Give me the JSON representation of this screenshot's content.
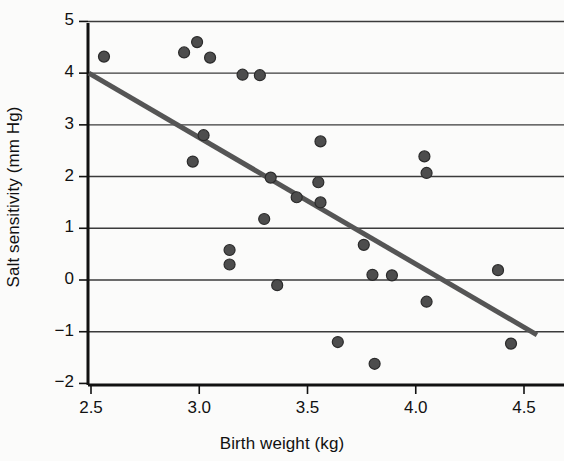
{
  "chart_data": {
    "type": "scatter",
    "title": "",
    "xlabel": "Birth weight (kg)",
    "ylabel": "Salt sensitivity (mm Hg)",
    "xlim": [
      2.4,
      4.62
    ],
    "ylim": [
      -2,
      5
    ],
    "xticks": [
      "2.5",
      "3.0",
      "3.5",
      "4.0",
      "4.5"
    ],
    "xtick_values": [
      2.5,
      3.0,
      3.5,
      4.0,
      4.5
    ],
    "yticks": [
      "5",
      "4",
      "3",
      "2",
      "1",
      "0",
      "−1",
      "−2"
    ],
    "ytick_values": [
      5,
      4,
      3,
      2,
      1,
      0,
      -1,
      -2
    ],
    "grid": "horizontal",
    "legend": "none",
    "marker": {
      "shape": "circle",
      "fill": "#4d4d4d",
      "stroke": "#2b2b2b",
      "size_px": 11
    },
    "points": [
      {
        "x": 2.56,
        "y": 4.32
      },
      {
        "x": 2.93,
        "y": 4.4
      },
      {
        "x": 2.99,
        "y": 4.6
      },
      {
        "x": 3.05,
        "y": 4.3
      },
      {
        "x": 3.2,
        "y": 3.97
      },
      {
        "x": 3.28,
        "y": 3.96
      },
      {
        "x": 3.02,
        "y": 2.8
      },
      {
        "x": 2.97,
        "y": 2.29
      },
      {
        "x": 3.33,
        "y": 1.98
      },
      {
        "x": 3.56,
        "y": 2.68
      },
      {
        "x": 3.55,
        "y": 1.89
      },
      {
        "x": 3.45,
        "y": 1.6
      },
      {
        "x": 3.56,
        "y": 1.5
      },
      {
        "x": 3.3,
        "y": 1.18
      },
      {
        "x": 3.14,
        "y": 0.58
      },
      {
        "x": 3.14,
        "y": 0.3
      },
      {
        "x": 3.36,
        "y": -0.1
      },
      {
        "x": 4.04,
        "y": 2.39
      },
      {
        "x": 4.05,
        "y": 2.07
      },
      {
        "x": 3.76,
        "y": 0.68
      },
      {
        "x": 3.8,
        "y": 0.1
      },
      {
        "x": 3.89,
        "y": 0.09
      },
      {
        "x": 4.05,
        "y": -0.42
      },
      {
        "x": 4.38,
        "y": 0.19
      },
      {
        "x": 3.64,
        "y": -1.2
      },
      {
        "x": 3.81,
        "y": -1.62
      },
      {
        "x": 4.44,
        "y": -1.23
      }
    ],
    "trendline": {
      "type": "linear-fit",
      "x_start": 2.49,
      "y_start": 4.0,
      "x_end": 4.56,
      "y_end": -1.06,
      "color": "#555555",
      "width_px": 5
    },
    "axis_color": "#111111",
    "gridline_color": "#3b3b3b",
    "background": "#fbfbfa"
  }
}
